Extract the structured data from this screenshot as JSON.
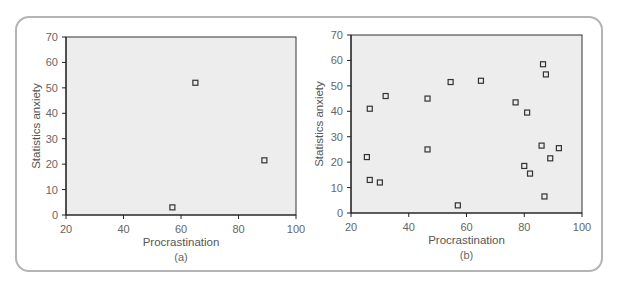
{
  "chart_data": [
    {
      "type": "scatter",
      "panel_label": "(a)",
      "xlabel": "Procrastination",
      "ylabel": "Statistics anxiety",
      "xlim": [
        20,
        100
      ],
      "ylim": [
        0,
        70
      ],
      "xticks": [
        20,
        40,
        60,
        80,
        100
      ],
      "yticks": [
        0,
        10,
        20,
        30,
        40,
        50,
        60,
        70
      ],
      "grid": false,
      "marker": "open-square",
      "plot_background": "#ededed",
      "points": [
        {
          "x": 57,
          "y": 3
        },
        {
          "x": 65,
          "y": 52
        },
        {
          "x": 89,
          "y": 21.5
        }
      ]
    },
    {
      "type": "scatter",
      "panel_label": "(b)",
      "xlabel": "Procrastination",
      "ylabel": "Statistics anxiety",
      "xlim": [
        20,
        100
      ],
      "ylim": [
        0,
        70
      ],
      "xticks": [
        20,
        40,
        60,
        80,
        100
      ],
      "yticks": [
        0,
        10,
        20,
        30,
        40,
        50,
        60,
        70
      ],
      "grid": false,
      "marker": "open-square",
      "plot_background": "#ededed",
      "points": [
        {
          "x": 25.5,
          "y": 22
        },
        {
          "x": 26.5,
          "y": 41
        },
        {
          "x": 26.5,
          "y": 13
        },
        {
          "x": 30,
          "y": 12
        },
        {
          "x": 32,
          "y": 46
        },
        {
          "x": 46.5,
          "y": 45
        },
        {
          "x": 46.5,
          "y": 25
        },
        {
          "x": 54.5,
          "y": 51.5
        },
        {
          "x": 57,
          "y": 3
        },
        {
          "x": 65,
          "y": 52
        },
        {
          "x": 77,
          "y": 43.5
        },
        {
          "x": 80,
          "y": 18.5
        },
        {
          "x": 81,
          "y": 39.5
        },
        {
          "x": 82,
          "y": 15.5
        },
        {
          "x": 86,
          "y": 26.5
        },
        {
          "x": 86.5,
          "y": 58.5
        },
        {
          "x": 87,
          "y": 6.5
        },
        {
          "x": 87.5,
          "y": 54.5
        },
        {
          "x": 89,
          "y": 21.5
        },
        {
          "x": 92,
          "y": 25.5
        }
      ]
    }
  ]
}
